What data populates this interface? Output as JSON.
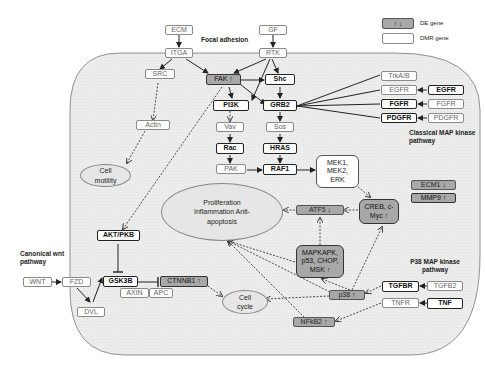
{
  "legend": {
    "de_symbol": "↑ ↓",
    "de_label": "DE gene",
    "dmr_label": "DMR gene"
  },
  "pathway_labels": {
    "focal_adhesion": "Focal adhesion",
    "classical_map": "Classical MAP kinase pathway",
    "canonical_wnt": "Canonical wnt pathway",
    "p38_map": "P38 MAP kinase pathway"
  },
  "nodes": {
    "ecm": "ECM",
    "itga": "ITGA",
    "gf": "GF",
    "rtk": "RTK",
    "src": "SRC",
    "fak": "FAK ↑",
    "shc": "Shc",
    "pi3k": "PI3K",
    "grb2": "GRB2",
    "actin": "Actin",
    "vav": "Vav",
    "sos": "Sos",
    "rac": "Rac",
    "hras": "HRAS",
    "pak": "PAK",
    "raf1": "RAF1",
    "mek": "MEK1, MEK2, ERK",
    "trkab": "TrkA/B",
    "egfr_in": "EGFR",
    "egfr_out": "EGFR",
    "fgfr_in": "FGFR",
    "fgfr_out": "FGFR",
    "pdgfr_in": "PDGFR",
    "pdgfr_out": "PDGFR",
    "ecm1": "ECM1 ↓",
    "mmp9": "MMP9 ↑",
    "atf5": "ATF5 ↓",
    "creb": "CREB, c-Myc ↑",
    "mapkapk": "MAPKAPK, p53, CHOP, MSK ↑",
    "akt": "AKT/PKB",
    "wnt": "WNT",
    "fzd": "FZD",
    "dvl": "DVL",
    "gsk3b": "GSK3B",
    "axin": "AXIN",
    "apc": "APC",
    "ctnnb1": "CTNNB1 ↑",
    "p38": "p38 ↑",
    "tgfbr": "TGFBR",
    "tgfb2": "TGFB2",
    "tnfr": "TNFR",
    "tnf": "TNF",
    "nfkb2": "NFkB2 ↑"
  },
  "ovals": {
    "cell_motility": "Cell motility",
    "proliferation": "Proliferation Inflammation Anti-apoptosis",
    "cell_cycle": "Cell cycle"
  },
  "colors": {
    "cell_fill": "#ececec",
    "de_fill": "#a8a8a8",
    "oval_fill": "#e6e6e6"
  }
}
